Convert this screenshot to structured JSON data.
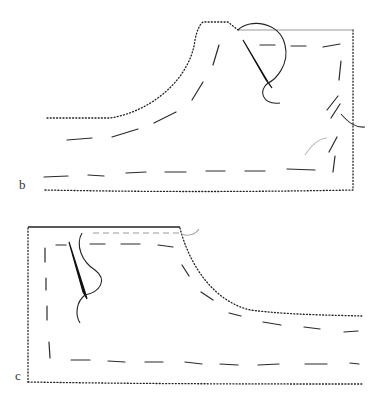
{
  "figures": [
    {
      "id": "b",
      "label": "b",
      "description": "Fabric piece with curved edge, running stitches and needle with thread"
    },
    {
      "id": "c",
      "label": "c",
      "description": "Fabric piece with curved edge, running stitches and needle with thread"
    }
  ],
  "colors": {
    "background": "#ffffff",
    "stroke": "#222222",
    "gray_stroke": "#999999"
  }
}
